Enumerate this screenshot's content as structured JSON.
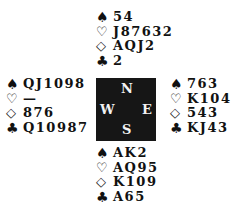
{
  "hands": {
    "north": {
      "spades": "54",
      "hearts": "J87632",
      "diamonds": "AQJ2",
      "clubs": "2"
    },
    "west": {
      "spades": "QJ1098",
      "hearts": "—",
      "diamonds": "876",
      "clubs": "Q10987"
    },
    "east": {
      "spades": "763",
      "hearts": "K104",
      "diamonds": "543",
      "clubs": "KJ43"
    },
    "south": {
      "spades": "AK2",
      "hearts": "AQ95",
      "diamonds": "K109",
      "clubs": "A65"
    }
  },
  "compass": {
    "n": "N",
    "s": "S",
    "w": "W",
    "e": "E"
  },
  "suit_symbols": {
    "spades": "♠",
    "hearts": "♡",
    "diamonds": "◇",
    "clubs": "♣"
  }
}
